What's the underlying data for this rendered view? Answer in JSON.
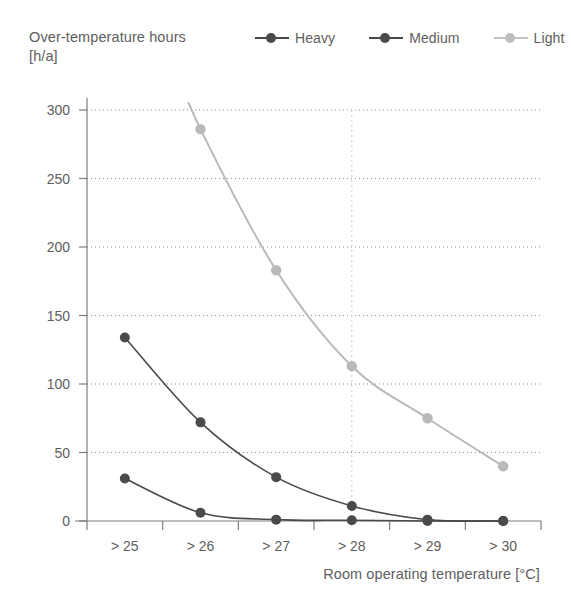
{
  "chart_data": {
    "type": "line",
    "title": "",
    "ylabel": "Over-temperature hours\n[h/a]",
    "ylabel_line1": "Over-temperature hours",
    "ylabel_line2": "[h/a]",
    "xlabel": "Room operating temperature [°C]",
    "categories": [
      "> 25",
      "> 26",
      "> 27",
      "> 28",
      "> 29",
      "> 30"
    ],
    "ylim": [
      0,
      300
    ],
    "yticks": [
      0,
      50,
      100,
      150,
      200,
      250,
      300
    ],
    "ytick_labels": [
      "0",
      "50",
      "100",
      "150",
      "200",
      "250",
      "300"
    ],
    "grid": "horizontal-dotted",
    "legend_position": "top-right",
    "annotation_vline_at": "> 28",
    "series": [
      {
        "name": "Heavy",
        "color": "#4a4a4a",
        "values": [
          31,
          6,
          1,
          0.5,
          0,
          0
        ],
        "marker": "circle"
      },
      {
        "name": "Medium",
        "color": "#4a4a4a",
        "values": [
          134,
          72,
          32,
          11,
          1,
          0
        ],
        "marker": "circle"
      },
      {
        "name": "Light",
        "color": "#b9b9b9",
        "values": [
          null,
          286,
          183,
          113,
          75,
          40
        ],
        "values_note": "value at > 25 is above the plotted axis maximum (clipped off-chart)",
        "marker": "circle"
      }
    ]
  },
  "legend": {
    "entries": [
      {
        "label": "Heavy",
        "color": "#4a4a4a"
      },
      {
        "label": "Medium",
        "color": "#4a4a4a"
      },
      {
        "label": "Light",
        "color": "#b9b9b9"
      }
    ]
  },
  "colors": {
    "heavy": "#4a4a4a",
    "medium": "#4a4a4a",
    "light": "#b9b9b9",
    "axis": "#7d7d7d",
    "grid": "#8d8d8d",
    "text": "#5e5e5e",
    "background": "#ffffff"
  }
}
